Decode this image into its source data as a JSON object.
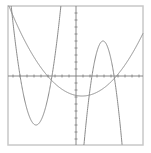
{
  "chart_data": {
    "type": "line",
    "title": "",
    "xlabel": "",
    "ylabel": "",
    "grid": false,
    "legend": null,
    "unit_px": 7,
    "origin_px": [
      76,
      76
    ],
    "frame_px": {
      "x0": 8,
      "y0": 6,
      "x1": 143,
      "y1": 145
    },
    "xlim": [
      -9.7,
      9.6
    ],
    "ylim": [
      -9.9,
      10
    ],
    "x_ticks_step": 1,
    "y_ticks_step": 1,
    "series": [
      {
        "name": "wide-upward-parabola",
        "form": "y = a(x - h)^2 + k",
        "vertex": [
          0.86,
          -2.86
        ],
        "a": 0.118,
        "color": "#8a8a8a"
      },
      {
        "name": "steep-upward-parabola",
        "form": "y = a(x - h)^2 + k",
        "vertex": [
          -5.71,
          -7.0
        ],
        "a": 1.35,
        "color": "#8a8a8a"
      },
      {
        "name": "steep-downward-parabola",
        "form": "y = a(x - h)^2 + k",
        "vertex": [
          3.86,
          5.0
        ],
        "a": -2.0,
        "color": "#8a8a8a"
      }
    ],
    "colors": {
      "frame": "#c8c8c8",
      "axis": "#7a7a7a",
      "curve": "#8a8a8a",
      "background": "#ffffff"
    }
  }
}
